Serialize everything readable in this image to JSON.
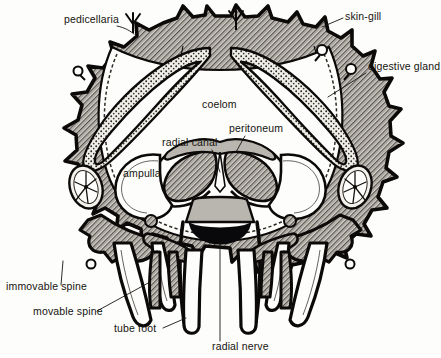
{
  "figure": {
    "background_color": "#fdfdfb",
    "ink_color": "#0c0a08",
    "labels": [
      {
        "id": "pedicellaria",
        "text": "pedicellaria",
        "x": 64,
        "y": 23,
        "anchor": "start"
      },
      {
        "id": "skin-gill",
        "text": "skin-gill",
        "x": 345,
        "y": 20,
        "anchor": "start"
      },
      {
        "id": "digestive-gland",
        "text": "digestive gland",
        "x": 368,
        "y": 70,
        "anchor": "start"
      },
      {
        "id": "coelom",
        "text": "coelom",
        "x": 202,
        "y": 108,
        "anchor": "start"
      },
      {
        "id": "peritoneum",
        "text": "peritoneum",
        "x": 229,
        "y": 132,
        "anchor": "start"
      },
      {
        "id": "radial-canal",
        "text": "radial canal",
        "x": 162,
        "y": 146,
        "anchor": "start"
      },
      {
        "id": "ampulla",
        "text": "ampulla",
        "x": 123,
        "y": 177,
        "anchor": "start"
      },
      {
        "id": "immovable-spine",
        "text": "immovable spine",
        "x": 6,
        "y": 290,
        "anchor": "start"
      },
      {
        "id": "movable-spine",
        "text": "movable spine",
        "x": 33,
        "y": 315,
        "anchor": "start"
      },
      {
        "id": "tube-foot",
        "text": "tube foot",
        "x": 114,
        "y": 332,
        "anchor": "start"
      },
      {
        "id": "radial-nerve",
        "text": "radial nerve",
        "x": 212,
        "y": 350,
        "anchor": "start"
      }
    ],
    "structures": [
      {
        "id": "body-wall",
        "name": "body wall",
        "texture": "crosshatch"
      },
      {
        "id": "digestive-gland",
        "name": "digestive gland",
        "texture": "stipple"
      },
      {
        "id": "coelom",
        "name": "coelom",
        "texture": "blank"
      },
      {
        "id": "radial-nerve",
        "name": "radial nerve",
        "texture": "solid-black"
      },
      {
        "id": "ossicle",
        "name": "skeletal ossicle",
        "texture": "spoked"
      }
    ]
  }
}
